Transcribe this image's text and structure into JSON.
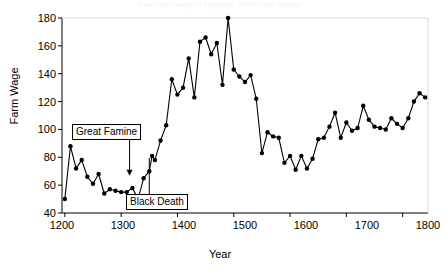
{
  "chart_data": {
    "type": "line",
    "title": "Real farm wage in England, 1200-1840 (index)",
    "xlabel": "Year",
    "ylabel": "Farm Wage",
    "xlim": [
      1195,
      1845
    ],
    "ylim": [
      40,
      180
    ],
    "xticks": [
      1200,
      1300,
      1400,
      1500,
      1600,
      1700,
      1800
    ],
    "yticks": [
      40,
      60,
      80,
      100,
      120,
      140,
      160,
      180
    ],
    "grid": false,
    "legend": null,
    "marker": "filled-circle",
    "line_color": "#000000",
    "marker_color": "#000000",
    "series": [
      {
        "name": "Farm Wage",
        "x": [
          1200,
          1210,
          1220,
          1230,
          1240,
          1250,
          1260,
          1270,
          1280,
          1290,
          1300,
          1310,
          1320,
          1330,
          1340,
          1350,
          1355,
          1360,
          1370,
          1380,
          1390,
          1400,
          1410,
          1420,
          1430,
          1440,
          1450,
          1460,
          1470,
          1480,
          1490,
          1500,
          1510,
          1520,
          1530,
          1540,
          1550,
          1560,
          1570,
          1580,
          1590,
          1600,
          1610,
          1620,
          1630,
          1640,
          1650,
          1660,
          1670,
          1680,
          1690,
          1700,
          1710,
          1720,
          1730,
          1740,
          1750,
          1760,
          1770,
          1780,
          1790,
          1800,
          1810,
          1820,
          1830,
          1840
        ],
        "y": [
          50,
          88,
          72,
          78,
          66,
          61,
          68,
          54,
          57,
          56,
          55,
          55,
          58,
          50,
          65,
          70,
          81,
          78,
          92,
          103,
          136,
          125,
          130,
          151,
          123,
          163,
          166,
          154,
          162,
          132,
          180,
          143,
          138,
          134,
          139,
          122,
          83,
          98,
          95,
          94,
          76,
          81,
          71,
          81,
          72,
          79,
          93,
          94,
          102,
          112,
          94,
          105,
          99,
          101,
          117,
          107,
          102,
          101,
          100,
          108,
          104,
          101,
          108,
          120,
          126,
          123
        ]
      }
    ],
    "annotations": [
      {
        "label": "Great Famine",
        "target_x": 1315,
        "target_y": 66,
        "arrow": "down-arrow"
      },
      {
        "label": "Black Death",
        "target_x": 1350,
        "target_y": 81,
        "arrow": "line"
      }
    ]
  }
}
